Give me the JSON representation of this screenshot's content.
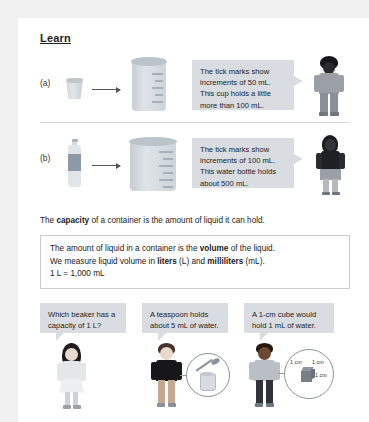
{
  "page": {
    "section_title": "Learn"
  },
  "examples": [
    {
      "label": "(a)",
      "source_icon": "cup-icon",
      "target_icon": "beaker-small-icon",
      "bubble": "The tick marks show increments of 50 mL. This cup holds a little more than 100 mL.",
      "character": "boy-character"
    },
    {
      "label": "(b)",
      "source_icon": "water-bottle-icon",
      "target_icon": "beaker-large-icon",
      "bubble": "The tick marks show increments of 100 mL. This water bottle holds about 500 mL.",
      "character": "girl-character"
    }
  ],
  "capacity_sentence": {
    "before": "The ",
    "bold": "capacity",
    "after": " of a container is the amount of liquid it can hold."
  },
  "infobox": {
    "line1_before": "The amount of liquid in a container is the ",
    "line1_bold": "volume",
    "line1_after": " of the liquid.",
    "line2_before": "We measure liquid volume in ",
    "line2_bold1": "liters",
    "line2_mid": " (L) and ",
    "line2_bold2": "milliliters",
    "line2_after": " (mL).",
    "line3": "1 L = 1,000 mL"
  },
  "panels": [
    {
      "bubble": "Which beaker has a capacity of 1 L?",
      "character": "girl-character",
      "scene": "none"
    },
    {
      "bubble": "A teaspoon holds about 5 mL of water.",
      "character": "boy-character",
      "scene": "teaspoon-magnifier"
    },
    {
      "bubble": "A 1-cm cube would hold 1 mL of water.",
      "character": "boy-character",
      "scene": "cube-magnifier",
      "cube_labels": [
        "1 cm",
        "1 cm",
        "1 cm"
      ]
    }
  ],
  "colors": {
    "page_background": "#ffffff",
    "canvas_background": "#f0f0f0",
    "bubble_fill": "#d9dde1",
    "glass": "#dfe4e8",
    "bottle_label": "#8d9aa6",
    "text": "#1a1a1a"
  }
}
